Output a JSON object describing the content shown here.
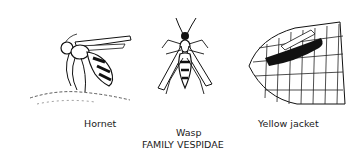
{
  "figure": {
    "family_label": "FAMILY VESPIDAE",
    "insects": [
      {
        "name": "Hornet",
        "icon": "hornet-illustration"
      },
      {
        "name": "Wasp",
        "icon": "wasp-illustration"
      },
      {
        "name": "Yellow jacket",
        "icon": "yellow-jacket-on-corn-illustration"
      }
    ]
  }
}
